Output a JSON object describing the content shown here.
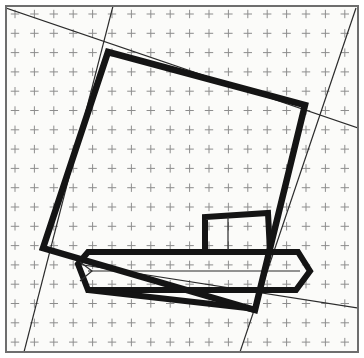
{
  "document": {
    "title": "Technical Line Drawing on Grid Paper",
    "width": 364,
    "height": 358,
    "background_color": "#ffffff"
  },
  "colors": {
    "paper": "#fbfbf9",
    "grid_mark": "#8d8d8d",
    "border": "#6e6e6e",
    "thin_line": "#2b2b2b",
    "thick_line": "#141414"
  },
  "paper": {
    "name": "graph-paper-sheet",
    "x": 6,
    "y": 6,
    "width": 352,
    "height": 346,
    "border_width": 2
  },
  "grid": {
    "type": "cross-ticks",
    "origin_x": 15,
    "origin_y": 14,
    "spacing_x": 19.4,
    "spacing_y": 19.3,
    "columns": 18,
    "rows": 18,
    "tick_arm": 4.2,
    "stroke_width": 1.0
  },
  "shapes": {
    "main_quadrilateral": {
      "name": "main-quadrilateral",
      "stroke_width": 6.5,
      "closed": true,
      "points": [
        [
          108,
          52
        ],
        [
          305,
          105
        ],
        [
          255,
          310
        ],
        [
          43,
          248
        ]
      ]
    },
    "horizontal_hexagon_bar": {
      "name": "horizontal-hexagon-bar",
      "stroke_width": 6.0,
      "closed": true,
      "points": [
        [
          78,
          264
        ],
        [
          88,
          252
        ],
        [
          298,
          252
        ],
        [
          310,
          271
        ],
        [
          296,
          290
        ],
        [
          88,
          290
        ]
      ]
    },
    "upper_small_rectangle": {
      "name": "upper-small-rectangle",
      "stroke_width": 6.0,
      "closed": false,
      "points": [
        [
          205,
          250
        ],
        [
          205,
          217
        ],
        [
          268,
          213
        ],
        [
          270,
          252
        ]
      ]
    },
    "lower_wedge": {
      "name": "lower-wedge-triangle",
      "stroke_width": 6.0,
      "closed": false,
      "points": [
        [
          88,
          290
        ],
        [
          247,
          308
        ],
        [
          255,
          310
        ]
      ]
    },
    "inner_detail_left": {
      "name": "inner-detail-left-taper",
      "stroke_width": 1.2,
      "closed": false,
      "points": [
        [
          80,
          262
        ],
        [
          92,
          271
        ],
        [
          80,
          281
        ]
      ]
    },
    "inner_detail_rect_divider": {
      "name": "inner-rectangle-divider",
      "stroke_width": 1.2,
      "closed": false,
      "points": [
        [
          228,
          217
        ],
        [
          228,
          250
        ]
      ]
    }
  },
  "thin_lines": [
    {
      "name": "thin-line-upper-left-diagonal",
      "points": [
        [
          6,
          8
        ],
        [
          358,
          128
        ]
      ],
      "stroke_width": 1.2
    },
    {
      "name": "thin-line-left-steep-diagonal",
      "points": [
        [
          113,
          6
        ],
        [
          24,
          352
        ]
      ],
      "stroke_width": 1.2
    },
    {
      "name": "thin-line-right-steep-diagonal",
      "points": [
        [
          356,
          8
        ],
        [
          240,
          352
        ]
      ],
      "stroke_width": 1.2
    },
    {
      "name": "thin-line-lower-shallow-diagonal",
      "points": [
        [
          77,
          264
        ],
        [
          358,
          308
        ]
      ],
      "stroke_width": 1.2
    },
    {
      "name": "thin-line-bar-midline",
      "points": [
        [
          88,
          271
        ],
        [
          300,
          271
        ]
      ],
      "stroke_width": 1.2
    }
  ],
  "legend": {
    "thick_label": "object outline",
    "thin_label": "construction line",
    "grid_label": "grid tick"
  }
}
